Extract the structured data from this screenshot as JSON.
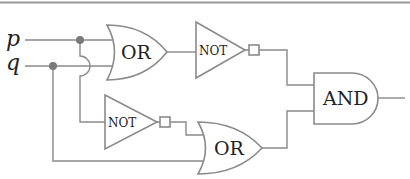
{
  "diagram": {
    "type": "logic-circuit",
    "inputs": [
      {
        "id": "p",
        "label": "p"
      },
      {
        "id": "q",
        "label": "q"
      }
    ],
    "gates": [
      {
        "id": "or1",
        "type": "OR",
        "label": "OR",
        "inputs": [
          "p",
          "q"
        ]
      },
      {
        "id": "not1",
        "type": "NOT",
        "label": "NOT",
        "inputs": [
          "or1"
        ]
      },
      {
        "id": "not2",
        "type": "NOT",
        "label": "NOT",
        "inputs": [
          "p"
        ]
      },
      {
        "id": "or2",
        "type": "OR",
        "label": "OR",
        "inputs": [
          "not2",
          "q"
        ]
      },
      {
        "id": "and1",
        "type": "AND",
        "label": "AND",
        "inputs": [
          "not1",
          "or2"
        ]
      }
    ],
    "output": {
      "from": "and1"
    },
    "colors": {
      "wire": "#8a8a8a",
      "node": "#7a7a7a",
      "border": "#999999",
      "text": "#222222"
    }
  }
}
